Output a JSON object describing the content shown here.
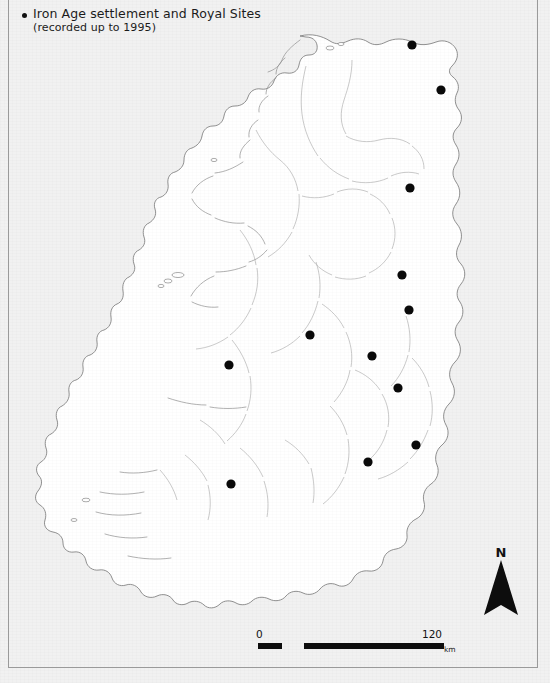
{
  "figure": {
    "kind": "thematic-distribution-map",
    "region": "Ireland",
    "frame_visible": true
  },
  "legend": {
    "bullet_symbol": "filled-circle",
    "line1": "Iron Age settlement and Royal Sites",
    "line2": "(recorded up to 1995)"
  },
  "north_arrow": {
    "label": "N"
  },
  "scale_bar": {
    "min_label": "0",
    "max_label": "120",
    "unit_label": "km",
    "segments": 4,
    "total_km": 120
  },
  "colors": {
    "page_background": "#f1f1f1",
    "land_fill": "#ffffff",
    "coastline": "#7d7d7d",
    "river": "#8f8f8f",
    "county_boundary": "#a6a6a6",
    "site_marker": "#0a0a0a",
    "frame": "#9a9a9a",
    "text": "#1b1b1b"
  },
  "sites": [
    {
      "id": "site-1",
      "x": 412,
      "y": 45
    },
    {
      "id": "site-2",
      "x": 441,
      "y": 90
    },
    {
      "id": "site-3",
      "x": 410,
      "y": 188
    },
    {
      "id": "site-4",
      "x": 402,
      "y": 275
    },
    {
      "id": "site-5",
      "x": 409,
      "y": 310
    },
    {
      "id": "site-6",
      "x": 310,
      "y": 335
    },
    {
      "id": "site-7",
      "x": 372,
      "y": 356
    },
    {
      "id": "site-8",
      "x": 229,
      "y": 365
    },
    {
      "id": "site-9",
      "x": 398,
      "y": 388
    },
    {
      "id": "site-10",
      "x": 416,
      "y": 445
    },
    {
      "id": "site-11",
      "x": 368,
      "y": 462
    },
    {
      "id": "site-12",
      "x": 231,
      "y": 484
    }
  ],
  "site_marker_radius": 4.6
}
